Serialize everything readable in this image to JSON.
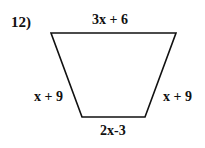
{
  "problem": {
    "number": "12)",
    "shape": "trapezoid",
    "sides": {
      "top": "3x + 6",
      "left": "x + 9",
      "right": "x + 9",
      "bottom": "2x-3"
    },
    "vertices": {
      "top_left": [
        51,
        33
      ],
      "top_right": [
        176,
        33
      ],
      "bottom_right": [
        145,
        117
      ],
      "bottom_left": [
        82,
        117
      ]
    },
    "stroke_color": "#111111",
    "background_color": "#ffffff"
  }
}
